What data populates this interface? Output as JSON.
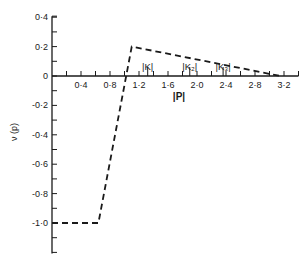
{
  "chart_data": {
    "type": "line",
    "title": "",
    "xlabel": "|P|",
    "ylabel": "ν (p)",
    "xlim": [
      0,
      3.4
    ],
    "ylim": [
      -1.2,
      0.4
    ],
    "grid": false,
    "legend": null,
    "x_tick_labels": [
      "0·4",
      "0·8",
      "1·2",
      "1·6",
      "2·0",
      "2·4",
      "2·8",
      "3·2"
    ],
    "x_tick_values": [
      0.4,
      0.8,
      1.2,
      1.6,
      2.0,
      2.4,
      2.8,
      3.2
    ],
    "x_minor_step": 0.2,
    "y_tick_labels": [
      "0·4",
      "0·2",
      "0",
      "-0·2",
      "-0·4",
      "-0·6",
      "-0·8",
      "-1·0"
    ],
    "y_tick_values": [
      0.4,
      0.2,
      0,
      -0.2,
      -0.4,
      -0.6,
      -0.8,
      -1.0
    ],
    "y_minor_step": 0.1,
    "series": [
      {
        "name": "ν(p)",
        "style": "dashed",
        "color": "#1a1a1a",
        "x": [
          0,
          0.64,
          1.1,
          3.15
        ],
        "y": [
          -1.0,
          -1.0,
          0.2,
          0
        ]
      }
    ],
    "annotations": [
      {
        "text": "|K|",
        "x": 1.32,
        "y": 0.07,
        "marker_x": 1.32
      },
      {
        "text": "|K₂|",
        "x": 1.9,
        "y": 0.07,
        "marker_x": 1.9
      },
      {
        "text": "|K₃|",
        "x": 2.36,
        "y": 0.07,
        "marker_x": 2.36
      }
    ]
  }
}
